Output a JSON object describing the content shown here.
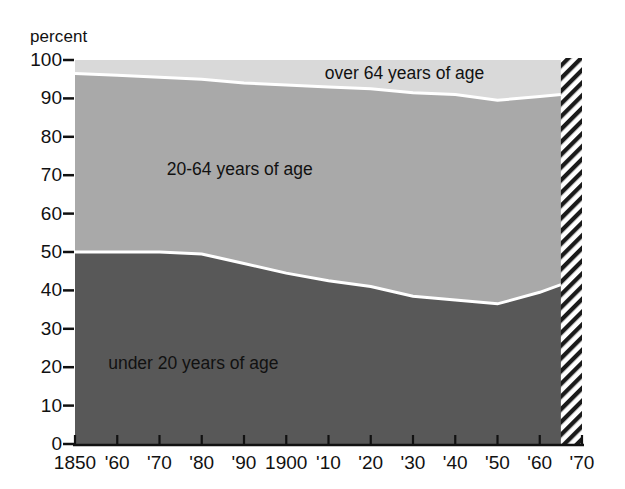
{
  "chart_data": {
    "type": "area",
    "stacked": true,
    "title": "",
    "subtitle": "",
    "xlabel": "",
    "ylabel": "percent",
    "axis_unit_label": "percent",
    "xlim": [
      1850,
      1970
    ],
    "ylim": [
      0,
      100
    ],
    "grid": false,
    "legend_position": "inline-labels",
    "x": [
      1850,
      1860,
      1870,
      1880,
      1890,
      1900,
      1910,
      1920,
      1930,
      1940,
      1950,
      1960,
      1965,
      1970
    ],
    "xtick_labels": [
      "1850",
      "'60",
      "'70",
      "'80",
      "'90",
      "1900",
      "'10",
      "'20",
      "'30",
      "'40",
      "'50",
      "'60",
      "'70"
    ],
    "xtick_values": [
      1850,
      1860,
      1870,
      1880,
      1890,
      1900,
      1910,
      1920,
      1930,
      1940,
      1950,
      1960,
      1970
    ],
    "ytick_labels": [
      "0",
      "10",
      "20",
      "30",
      "40",
      "50",
      "60",
      "70",
      "80",
      "90",
      "100"
    ],
    "ytick_values": [
      0,
      10,
      20,
      30,
      40,
      50,
      60,
      70,
      80,
      90,
      100
    ],
    "series": [
      {
        "name": "under 20 years of age",
        "label": "under 20 years of age",
        "color": "#585858",
        "values": [
          50.0,
          50.0,
          50.0,
          49.5,
          47.0,
          44.5,
          42.5,
          41.0,
          38.5,
          37.5,
          36.5,
          39.5,
          41.5,
          42.0
        ]
      },
      {
        "name": "20-64 years of age",
        "label": "20-64 years of age",
        "color": "#a9a9a9",
        "values": [
          46.5,
          46.0,
          45.5,
          45.5,
          47.0,
          49.0,
          50.5,
          51.5,
          53.0,
          53.5,
          53.0,
          51.0,
          49.5,
          49.0
        ]
      },
      {
        "name": "over 64 years of age",
        "label": "over 64 years of age",
        "color": "#d9d9d9",
        "values": [
          3.5,
          4.0,
          4.5,
          5.0,
          6.0,
          6.5,
          7.0,
          7.5,
          8.5,
          9.0,
          10.5,
          9.5,
          9.0,
          9.0
        ]
      }
    ],
    "cumulative_upper_boundaries": {
      "under_20": [
        50.0,
        50.0,
        50.0,
        49.5,
        47.0,
        44.5,
        42.5,
        41.0,
        38.5,
        37.5,
        36.5,
        39.5,
        41.5,
        42.0
      ],
      "under_20_plus_20_64": [
        96.5,
        96.0,
        95.5,
        95.0,
        94.0,
        93.5,
        93.0,
        92.5,
        91.5,
        91.0,
        89.5,
        90.5,
        91.0,
        91.0
      ]
    },
    "projection_region": {
      "label": "",
      "start_year": 1965,
      "end_year": 1970,
      "style": "diagonal-hatch"
    },
    "band_label_positions": [
      {
        "label": "over 64 years of age",
        "x_year": 1928,
        "y_percent": 96.5
      },
      {
        "label": "20-64 years of age",
        "x_year": 1889,
        "y_percent": 71.5
      },
      {
        "label": "under 20 years of age",
        "x_year": 1878,
        "y_percent": 21.0
      }
    ],
    "colors": {
      "under_20": "#585858",
      "age_20_64": "#a9a9a9",
      "over_64": "#d9d9d9",
      "separator_line": "#ffffff",
      "axis": "#111111",
      "background": "#ffffff"
    }
  }
}
